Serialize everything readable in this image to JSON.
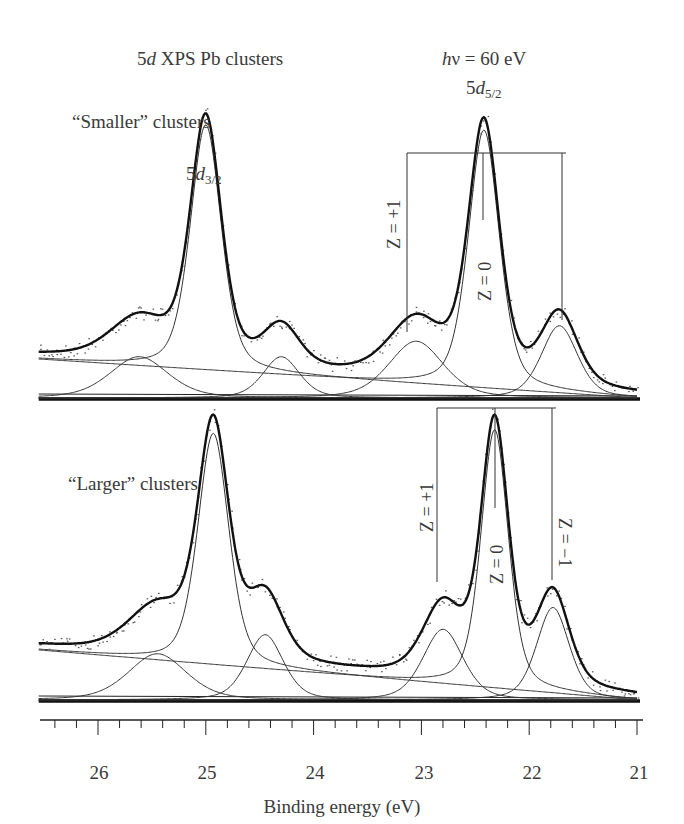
{
  "figure": {
    "title_prefix": "5",
    "title_italic": "d",
    "title_suffix": " XPS Pb clusters",
    "photon_energy_h": "h",
    "photon_energy_rest": "ν = 60 eV",
    "peak_label_52_main": "5",
    "peak_label_52_d": "d",
    "peak_label_52_sub": "5/2",
    "peak_label_32_main": "5",
    "peak_label_32_d": "d",
    "peak_label_32_sub": "3/2",
    "top_panel_label": "“Smaller” clusters",
    "bottom_panel_label": "“Larger” clusters",
    "top_z_plus": "Z = +1",
    "top_z_zero": "Z = 0",
    "bottom_z_plus": "Z = +1",
    "bottom_z_zero": "Z = 0",
    "bottom_z_minus": "Z = −1",
    "xlabel": "Binding energy (eV)",
    "ticks": [
      "26",
      "25",
      "24",
      "23",
      "22",
      "21"
    ]
  },
  "chart_data": [
    {
      "type": "line",
      "title": "5d XPS Pb clusters — “Smaller” clusters (hν = 60 eV)",
      "xlabel": "Binding energy (eV)",
      "ylabel": "",
      "xlim": [
        26.55,
        21.0
      ],
      "x_reversed": true,
      "grid": false,
      "legend": null,
      "components": [
        {
          "name": "5d3/2 Z=0",
          "center_eV": 25.0,
          "rel_height": 0.95
        },
        {
          "name": "5d3/2 Z=+1",
          "center_eV": 25.62,
          "rel_height": 0.16
        },
        {
          "name": "5d3/2 Z=-1",
          "center_eV": 24.3,
          "rel_height": 0.16
        },
        {
          "name": "5d5/2 Z=+1",
          "center_eV": 23.05,
          "rel_height": 0.22
        },
        {
          "name": "5d5/2 Z=0",
          "center_eV": 22.42,
          "rel_height": 1.0
        },
        {
          "name": "5d5/2 Z=-1",
          "center_eV": 21.72,
          "rel_height": 0.28
        }
      ],
      "annotations": [
        {
          "text": "5d5/2",
          "bracket_eV": [
            23.12,
            21.7
          ],
          "center_eV": 22.42
        },
        {
          "text": "5d3/2",
          "at_eV": 25.0
        },
        {
          "text": "Z = +1",
          "at_eV": 23.12
        },
        {
          "text": "Z = 0",
          "at_eV": 22.42
        }
      ]
    },
    {
      "type": "line",
      "title": "5d XPS Pb clusters — “Larger” clusters (hν = 60 eV)",
      "xlabel": "Binding energy (eV)",
      "ylabel": "",
      "xlim": [
        26.55,
        21.0
      ],
      "x_reversed": true,
      "grid": false,
      "legend": null,
      "components": [
        {
          "name": "5d3/2 Z=0",
          "center_eV": 24.93,
          "rel_height": 0.85
        },
        {
          "name": "5d3/2 Z=+1",
          "center_eV": 25.45,
          "rel_height": 0.17
        },
        {
          "name": "5d3/2 Z=-1",
          "center_eV": 24.45,
          "rel_height": 0.24
        },
        {
          "name": "5d5/2 Z=+1",
          "center_eV": 22.8,
          "rel_height": 0.26
        },
        {
          "name": "5d5/2 Z=0",
          "center_eV": 22.32,
          "rel_height": 0.95
        },
        {
          "name": "5d5/2 Z=-1",
          "center_eV": 21.78,
          "rel_height": 0.34
        }
      ],
      "annotations": [
        {
          "text": "Z = +1",
          "at_eV": 22.85
        },
        {
          "text": "Z = 0",
          "at_eV": 22.32
        },
        {
          "text": "Z = −1",
          "at_eV": 21.78
        }
      ]
    }
  ],
  "x_axis": {
    "ticks_major": [
      26,
      25,
      24,
      23,
      22,
      21
    ],
    "minor_step": 0.2,
    "range": [
      26.55,
      21.0
    ]
  }
}
